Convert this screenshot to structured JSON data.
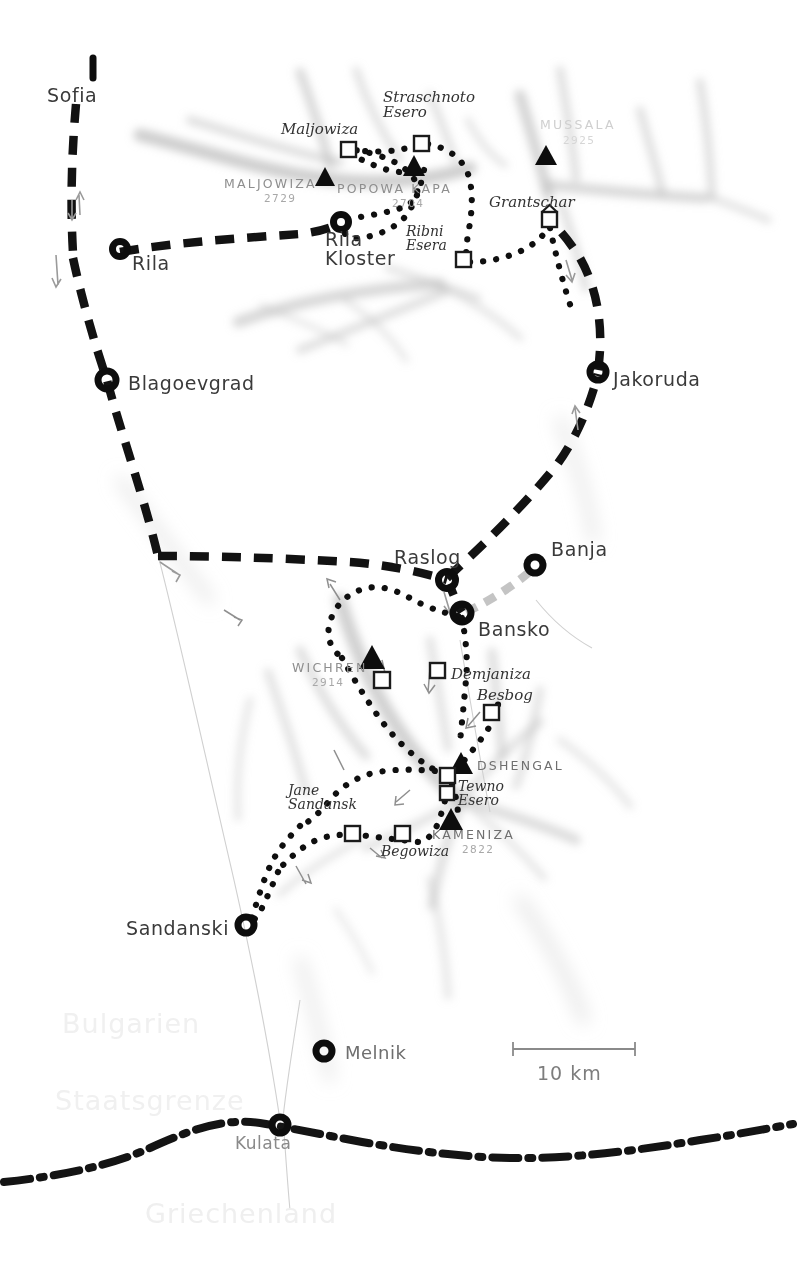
{
  "map": {
    "title": "Rila and Pirin mountains trekking map",
    "scale_bar": {
      "label": "10 km",
      "length_px": 100
    },
    "colors": {
      "ink": "#1c1c1c",
      "terrain": "#b8b8b8",
      "ghost_text": "#f0f0f0",
      "peak_text": "#8e8e8e",
      "town_text": "#3a3a3a"
    },
    "country_labels": [
      {
        "name": "bulgarien",
        "text": "Bulgarien",
        "x": 62,
        "y": 1008
      },
      {
        "name": "staatsgrenze",
        "text": "Staatsgrenze",
        "x": 55,
        "y": 1085
      },
      {
        "name": "griechenland",
        "text": "Griechenland",
        "x": 145,
        "y": 1198
      }
    ],
    "towns": [
      {
        "name": "sofia",
        "label": "Sofia",
        "x": 47,
        "y": 84,
        "marker": "arrow-off-map",
        "mx": 93,
        "my": 68
      },
      {
        "name": "rila",
        "label": "Rila",
        "x": 132,
        "y": 252,
        "marker": "circle",
        "mx": 120,
        "my": 249
      },
      {
        "name": "rila-kloster",
        "label": "Rila\nKloster",
        "x": 325,
        "y": 230,
        "marker": "circle",
        "mx": 341,
        "my": 222
      },
      {
        "name": "blagoevgrad",
        "label": "Blagoevgrad",
        "x": 128,
        "y": 372,
        "marker": "circle",
        "mx": 107,
        "my": 380
      },
      {
        "name": "jakoruda",
        "label": "Jakoruda",
        "x": 613,
        "y": 379,
        "marker": "circle",
        "mx": 598,
        "my": 372
      },
      {
        "name": "raslog",
        "label": "Raslog",
        "x": 394,
        "y": 552,
        "marker": "circle",
        "mx": 447,
        "my": 580
      },
      {
        "name": "banja",
        "label": "Banja",
        "x": 551,
        "y": 546,
        "marker": "circle",
        "mx": 535,
        "my": 565
      },
      {
        "name": "bansko",
        "label": "Bansko",
        "x": 478,
        "y": 629,
        "marker": "circle",
        "mx": 462,
        "my": 613
      },
      {
        "name": "sandanski",
        "label": "Sandanski",
        "x": 126,
        "y": 928,
        "marker": "circle",
        "mx": 246,
        "my": 925
      },
      {
        "name": "melnik",
        "label": "Melnik",
        "x": 345,
        "y": 1051,
        "marker": "circle",
        "mx": 324,
        "my": 1051
      },
      {
        "name": "kulata",
        "label": "Kulata",
        "x": 235,
        "y": 1141,
        "marker": "circle",
        "mx": 280,
        "my": 1125
      }
    ],
    "peaks": [
      {
        "name": "maljowiza-peak",
        "label": "MALJOWIZA",
        "elevation": "2729",
        "lx": 224,
        "ly": 182,
        "ex": 264,
        "ey": 196,
        "tx": 325,
        "ty": 177
      },
      {
        "name": "popowa-kapa-peak",
        "label": "POPOWA  KAPA",
        "elevation": "2704",
        "lx": 337,
        "ly": 187,
        "ex": 392,
        "ey": 202,
        "tx": 414,
        "ty": 165
      },
      {
        "name": "mussala-peak",
        "label": "MUSSALA",
        "elevation": "2925",
        "lx": 540,
        "ly": 123,
        "ex": 563,
        "ey": 140,
        "tx": 546,
        "ty": 155
      },
      {
        "name": "wichren-peak",
        "label": "WICHREN",
        "elevation": "2914",
        "lx": 292,
        "ly": 666,
        "ex": 312,
        "ey": 681,
        "tx": 372,
        "ty": 655
      },
      {
        "name": "kameniza-peak",
        "label": "KAMENIZA",
        "elevation": "2822",
        "lx": 432,
        "ly": 833,
        "ex": 462,
        "ey": 848,
        "tx": 451,
        "ty": 818
      },
      {
        "name": "dshengal-peak",
        "label": "DSHENGAL",
        "elevation": "",
        "lx": 477,
        "ly": 765,
        "ex": 0,
        "ey": 0,
        "tx": 461,
        "ty": 762
      }
    ],
    "huts": [
      {
        "name": "maljowiza-hut",
        "label": "Maljowiza",
        "lx": 281,
        "ly": 130,
        "hx": 348,
        "hy": 149
      },
      {
        "name": "straschnoto-hut",
        "label": "Straschnoto\nEsero",
        "lx": 383,
        "ly": 98,
        "hx": 421,
        "hy": 143
      },
      {
        "name": "ribni-esera-hut",
        "label": "Ribni\nEsera",
        "lx": 406,
        "ly": 232,
        "hx": 463,
        "hy": 259
      },
      {
        "name": "grantschar-hut",
        "label": "Grantschar",
        "lx": 489,
        "ly": 203,
        "hx": 549,
        "hy": 219
      },
      {
        "name": "demjaniza-hut",
        "label": "Demjaniza",
        "lx": 451,
        "ly": 675,
        "hx": 437,
        "hy": 670
      },
      {
        "name": "besbog-hut",
        "label": "Besbog",
        "lx": 477,
        "ly": 696,
        "hx": 491,
        "hy": 712
      },
      {
        "name": "tewno-esero-lake",
        "label": "Tewno\nEsero",
        "lx": 458,
        "ly": 787,
        "hx": 447,
        "hy": 775
      },
      {
        "name": "jane-sandanski-hut",
        "label": "Jane\nSandansk",
        "lx": 288,
        "ly": 791,
        "hx": 352,
        "hy": 833
      },
      {
        "name": "begowiza-hut",
        "label": "Begowiza",
        "lx": 381,
        "ly": 850,
        "hx": 402,
        "hy": 833
      }
    ],
    "legend_note": "dashed = road, dotted = trekking trail, dash-dot = state border"
  }
}
